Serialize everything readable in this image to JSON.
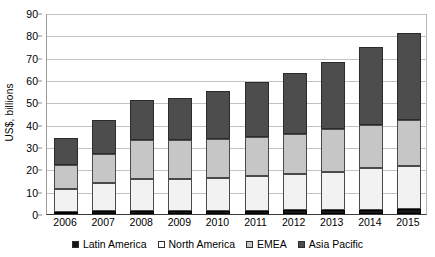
{
  "chart_data": {
    "type": "bar",
    "subtype": "stacked-bar",
    "title": "",
    "xlabel": "",
    "ylabel": "US$, billions",
    "ylim": [
      0,
      90
    ],
    "ytick_step": 10,
    "yticks": [
      0,
      10,
      20,
      30,
      40,
      50,
      60,
      70,
      80,
      90
    ],
    "grid": true,
    "legend_position": "bottom",
    "categories": [
      "2006",
      "2007",
      "2008",
      "2009",
      "2010",
      "2011",
      "2012",
      "2013",
      "2014",
      "2015"
    ],
    "series": [
      {
        "name": "Latin America",
        "color": "#161616",
        "values": [
          1.0,
          1.2,
          1.3,
          1.3,
          1.4,
          1.5,
          1.6,
          1.7,
          1.9,
          2.1
        ]
      },
      {
        "name": "North America",
        "color": "#f2f2f2",
        "values": [
          10.0,
          12.8,
          14.2,
          14.2,
          14.8,
          15.5,
          16.4,
          17.3,
          18.6,
          19.4
        ]
      },
      {
        "name": "EMEA",
        "color": "#c6c6c6",
        "values": [
          11.0,
          13.0,
          17.5,
          17.5,
          17.3,
          17.5,
          18.0,
          19.0,
          19.5,
          20.5
        ]
      },
      {
        "name": "Asia Pacific",
        "color": "#4d4d4d",
        "values": [
          12.0,
          15.0,
          18.0,
          19.0,
          21.5,
          24.5,
          27.0,
          30.0,
          35.0,
          39.0
        ]
      }
    ],
    "totals": [
      34,
      42,
      51,
      52,
      55,
      59,
      63,
      68,
      75,
      81
    ],
    "legend": [
      "Latin America",
      "North America",
      "EMEA",
      "Asia Pacific"
    ]
  }
}
